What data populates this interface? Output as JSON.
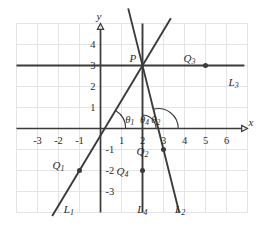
{
  "figure": {
    "background": "#ffffff",
    "grid_color": "#e3e3e8",
    "axis_color": "#3a3a3a",
    "line_color": "#3a3a3a",
    "text_color": "#2b2b2b"
  },
  "axes": {
    "x_label": "x",
    "y_label": "y",
    "x_ticks": [
      "-3",
      "-2",
      "-1",
      "1",
      "2",
      "3",
      "4",
      "5",
      "6"
    ],
    "x_tick_values": [
      -3,
      -2,
      -1,
      1,
      2,
      3,
      4,
      5,
      6
    ],
    "y_ticks": [
      "4",
      "3",
      "2",
      "1",
      "-1",
      "-2",
      "-3"
    ],
    "y_tick_values": [
      4,
      3,
      2,
      1,
      -1,
      -2,
      -3
    ],
    "xlim": [
      -4,
      7
    ],
    "ylim": [
      -4,
      5
    ],
    "grid": true,
    "grid_step": 1
  },
  "chart_data": {
    "type": "line",
    "xlabel": "x",
    "ylabel": "y",
    "xlim": [
      -4,
      7
    ],
    "ylim": [
      -4,
      5
    ],
    "grid": true,
    "legend": "none",
    "series": [
      {
        "name": "L1",
        "label": "L",
        "sub": "1",
        "through": [
          [
            2,
            3
          ],
          [
            -1,
            -2
          ]
        ],
        "slope": 1.6667,
        "intercept": -0.3333,
        "x_from": -2.3,
        "x_to": 3.35,
        "label_x": -1.75,
        "label_y": -3.6
      },
      {
        "name": "L2",
        "label": "L",
        "sub": "2",
        "through": [
          [
            2,
            3
          ],
          [
            3,
            -1
          ]
        ],
        "slope": -4.0,
        "intercept": 11.0,
        "x_from": 1.32,
        "x_to": 3.75,
        "label_x": 3.55,
        "label_y": -3.6
      },
      {
        "name": "L3",
        "label": "L",
        "sub": "3",
        "through": [
          [
            2,
            3
          ],
          [
            5,
            3
          ]
        ],
        "slope": 0.0,
        "intercept": 3.0,
        "x_from": -4.0,
        "x_to": 6.85,
        "label_x": 6.1,
        "label_y": 2.45
      },
      {
        "name": "L4",
        "label": "L",
        "sub": "4",
        "through": [
          [
            2,
            3
          ],
          [
            2,
            -2
          ]
        ],
        "slope": null,
        "vertical_x": 2,
        "y_from": -4.0,
        "y_to": 5.0,
        "label_x": 1.75,
        "label_y": -3.6
      }
    ],
    "points": [
      {
        "name": "P",
        "label": "P",
        "sub": "",
        "x": 2,
        "y": 3,
        "label_dx": -13,
        "label_dy": -13,
        "dot": false
      },
      {
        "name": "Q1",
        "label": "Q",
        "sub": "1",
        "x": -1,
        "y": -2,
        "label_dx": -27,
        "label_dy": -11,
        "dot": true
      },
      {
        "name": "Q2",
        "label": "Q",
        "sub": "2",
        "x": 3,
        "y": -1,
        "label_dx": -27,
        "label_dy": -4,
        "dot": true
      },
      {
        "name": "Q3",
        "label": "Q",
        "sub": "3",
        "x": 5,
        "y": 3,
        "label_dx": -22,
        "label_dy": -13,
        "dot": true
      },
      {
        "name": "Q4",
        "label": "Q",
        "sub": "4",
        "x": 2,
        "y": -2,
        "label_dx": -26,
        "label_dy": -5,
        "dot": true
      }
    ],
    "angles": [
      {
        "name": "theta1",
        "label": "θ",
        "sub": "1",
        "vertex_x": 1.4,
        "vertex_y": 0,
        "label_x": 1.18,
        "label_y": 0.62,
        "description": "angle of L1 with positive x-axis"
      },
      {
        "name": "theta4",
        "label": "θ",
        "sub": "4",
        "vertex_x": 2,
        "vertex_y": 0,
        "label_x": 1.88,
        "label_y": 0.62,
        "description": "angle of L4 with positive x-axis"
      },
      {
        "name": "theta2",
        "label": "θ",
        "sub": "2",
        "vertex_x": 2.75,
        "vertex_y": 0,
        "label_x": 2.42,
        "label_y": 0.62,
        "description": "angle of L2 with positive x-axis"
      }
    ]
  }
}
